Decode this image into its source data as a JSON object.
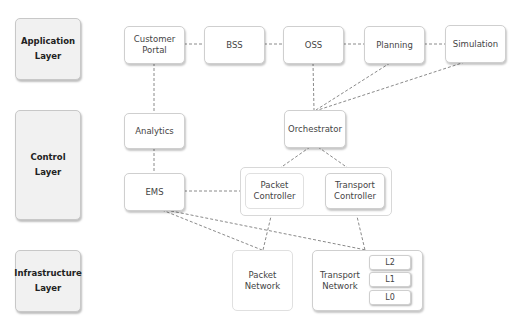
{
  "layers": [
    {
      "id": "application",
      "label": "Application\nLayer"
    },
    {
      "id": "control",
      "label": "Control\nLayer"
    },
    {
      "id": "infrastructure",
      "label": "Infrastructure\nLayer"
    }
  ],
  "nodes": {
    "customer_portal": "Customer\nPortal",
    "bss": "BSS",
    "oss": "OSS",
    "planning": "Planning",
    "simulation": "Simulation",
    "analytics": "Analytics",
    "orchestrator": "Orchestrator",
    "ems": "EMS",
    "packet_controller": "Packet\nController",
    "transport_controller": "Transport\nController",
    "packet_network": "Packet\nNetwork",
    "transport_network": "Transport\nNetwork"
  },
  "transport_layers": [
    "L2",
    "L1",
    "L0"
  ],
  "connections": [
    [
      "Customer Portal",
      "BSS"
    ],
    [
      "BSS",
      "OSS"
    ],
    [
      "OSS",
      "Planning"
    ],
    [
      "Planning",
      "Simulation"
    ],
    [
      "Customer Portal",
      "Analytics"
    ],
    [
      "Analytics",
      "EMS"
    ],
    [
      "OSS",
      "Orchestrator"
    ],
    [
      "Planning",
      "Orchestrator"
    ],
    [
      "Simulation",
      "Orchestrator"
    ],
    [
      "Orchestrator",
      "Packet Controller"
    ],
    [
      "Orchestrator",
      "Transport Controller"
    ],
    [
      "EMS",
      "Packet Controller"
    ],
    [
      "Packet Controller",
      "Transport Controller"
    ],
    [
      "EMS",
      "Packet Network"
    ],
    [
      "EMS",
      "Transport Network"
    ],
    [
      "Packet Controller",
      "Packet Network"
    ],
    [
      "Transport Controller",
      "Transport Network"
    ]
  ],
  "colors": {
    "line": "#888888",
    "layer_fill": "#f1f1f1",
    "node_fill": "#ffffff",
    "border": "#cfcfcf"
  }
}
